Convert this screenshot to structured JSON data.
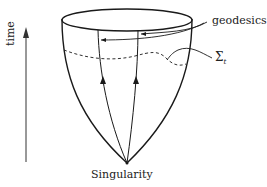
{
  "diagram": {
    "labels": {
      "geodesics": "geodesics",
      "sigma": "Σ",
      "sigma_sub": "t",
      "singularity": "Singularity",
      "time": "time"
    },
    "colors": {
      "stroke": "#1a1a1a",
      "background": "#ffffff"
    }
  }
}
